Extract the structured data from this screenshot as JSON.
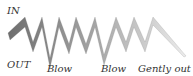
{
  "labels": {
    "in": "IN",
    "out": "OUT",
    "blow1": "Blow",
    "blow2": "Blow",
    "gently_out": "Gently out"
  },
  "colors": {
    "band_start": "#707070",
    "band_end": "#e6e6e6",
    "label": "#333333"
  }
}
